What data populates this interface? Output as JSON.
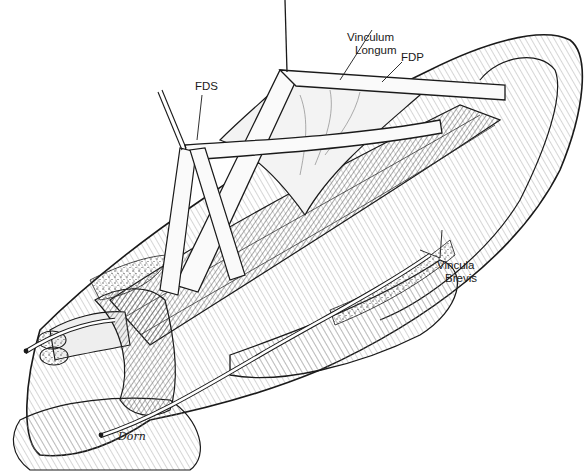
{
  "figure": {
    "colors": {
      "ink": "#1a1a1a",
      "paper": "#ffffff",
      "shade": "#9a9a9a"
    }
  },
  "labels": {
    "vinculum_longum_line1": "Vinculum",
    "vinculum_longum_line2": "Longum",
    "fdp": "FDP",
    "fds": "FDS",
    "vincula_brevis_line1": "Vincula",
    "vincula_brevis_line2": "Brevis"
  },
  "signature": "Dorn"
}
